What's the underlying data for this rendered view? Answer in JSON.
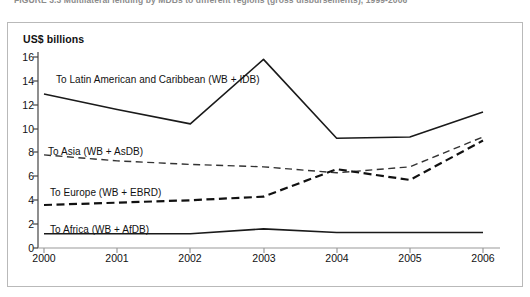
{
  "figure": {
    "title": "FIGURE 3.3   Multilateral lending by MDBs to different regions (gross disbursements), 1999-2006",
    "unit_label": "US$ billions"
  },
  "chart_data": {
    "type": "line",
    "title": "Multilateral lending by MDBs to different regions (gross disbursements)",
    "xlabel": "",
    "ylabel": "US$ billions",
    "x": [
      "2000",
      "2001",
      "2002",
      "2003",
      "2004",
      "2005",
      "2006"
    ],
    "xlim": [
      "2000",
      "2006"
    ],
    "ylim": [
      0,
      16
    ],
    "yticks": [
      "0",
      "2",
      "4",
      "6",
      "8",
      "10",
      "12",
      "14",
      "16"
    ],
    "grid": false,
    "legend_position": "inline-labels",
    "series": [
      {
        "name": "To Latin American and Caribbean (WB + IDB)",
        "style": "solid",
        "color": "#1a1a1a",
        "values": [
          12.9,
          11.6,
          10.4,
          15.8,
          9.2,
          9.3,
          11.4
        ]
      },
      {
        "name": "To Asia (WB + AsDB)",
        "style": "dashed-thin",
        "color": "#333333",
        "values": [
          7.8,
          7.3,
          7.0,
          6.8,
          6.3,
          6.8,
          9.3
        ]
      },
      {
        "name": "To Europe (WB + EBRD)",
        "style": "dashed-thick",
        "color": "#111111",
        "values": [
          3.6,
          3.8,
          4.0,
          4.3,
          6.6,
          5.7,
          9.0
        ]
      },
      {
        "name": "To Africa (WB + AfDB)",
        "style": "solid",
        "color": "#1a1a1a",
        "values": [
          1.2,
          1.2,
          1.2,
          1.6,
          1.3,
          1.3,
          1.3
        ]
      }
    ],
    "annotations": [
      {
        "text": "To Latin American and Caribbean (WB + IDB)",
        "x": 2000,
        "y": 14.0
      },
      {
        "text": "To Asia (WB + AsDB)",
        "x": 2000,
        "y": 8.4
      },
      {
        "text": "To Europe (WB + EBRD)",
        "x": 2000,
        "y": 5.0
      },
      {
        "text": "To Africa (WB + AfDB)",
        "x": 2000,
        "y": 2.0
      }
    ]
  }
}
